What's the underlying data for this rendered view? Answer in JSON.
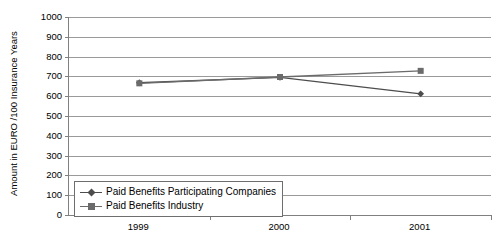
{
  "chart_data": {
    "type": "line",
    "title": "",
    "xlabel": "",
    "ylabel": "Amount in EURO /100 Insurance Years",
    "categories": [
      "1999",
      "2000",
      "2001"
    ],
    "x": [
      1999,
      2000,
      2001
    ],
    "ylim": [
      0,
      1000
    ],
    "y_ticks": [
      "0",
      "100",
      "200",
      "300",
      "400",
      "500",
      "600",
      "700",
      "800",
      "900",
      "1000"
    ],
    "y_tick_values": [
      0,
      100,
      200,
      300,
      400,
      500,
      600,
      700,
      800,
      900,
      1000
    ],
    "grid": true,
    "legend_position": "inside-bottom-left",
    "series": [
      {
        "name": "Paid Benefits Participating Companies",
        "marker": "diamond",
        "color": "#4d4d4d",
        "values": [
          668,
          695,
          612
        ]
      },
      {
        "name": "Paid Benefits Industry",
        "marker": "square",
        "color": "#6b6b6b",
        "values": [
          665,
          697,
          728
        ]
      }
    ]
  },
  "legend": {
    "items": [
      {
        "label": "Paid Benefits Participating Companies",
        "marker": "diamond-marker-icon"
      },
      {
        "label": "Paid Benefits Industry",
        "marker": "square-marker-icon"
      }
    ]
  },
  "colors": {
    "axis": "#808080",
    "gridline": "#9a9a9a",
    "series_participating": "#4d4d4d",
    "series_industry": "#6b6b6b",
    "text": "#000000",
    "background": "#ffffff"
  }
}
